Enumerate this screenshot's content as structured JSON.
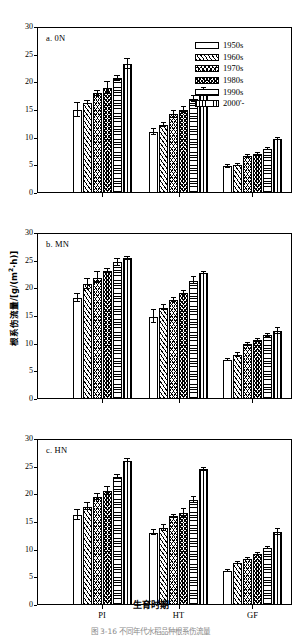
{
  "figure": {
    "ylabel": "根系伤流量/[g/(m2·h)]",
    "xlabel": "生育时期",
    "caption": "图 3-16   不同年代水稻品种根系伤流量"
  },
  "legend": {
    "items": [
      {
        "label": "1950s",
        "pattern": "p0"
      },
      {
        "label": "1960s",
        "pattern": "p1"
      },
      {
        "label": "1970s",
        "pattern": "p2"
      },
      {
        "label": "1980s",
        "pattern": "p3"
      },
      {
        "label": "1990s",
        "pattern": "p4"
      },
      {
        "label": "2000'-",
        "pattern": "p5"
      }
    ]
  },
  "axis": {
    "yticks": [
      "0",
      "5",
      "10",
      "15",
      "20",
      "25",
      "30"
    ],
    "ymin": 0,
    "ymax": 30,
    "categories": [
      "PI",
      "HT",
      "GF"
    ]
  },
  "chart_data": {
    "type": "bar",
    "title": "根系伤流量/[g/(m2·h)]",
    "xlabel": "生育时期",
    "ylabel": "根系伤流量/[g/(m2·h)]",
    "ylim": [
      0,
      30
    ],
    "yticks": [
      0,
      5,
      10,
      15,
      20,
      25,
      30
    ],
    "grid": false,
    "legend_position": "top-right of panel a",
    "categories": [
      "PI",
      "HT",
      "GF"
    ],
    "panels": [
      {
        "key": "a",
        "label": "a. 0N",
        "series": [
          {
            "name": "1950s",
            "pattern": "p0",
            "values": [
              15.0,
              11.0,
              4.8
            ],
            "errors": [
              1.2,
              0.5,
              0.2
            ]
          },
          {
            "name": "1960s",
            "pattern": "p1",
            "values": [
              16.3,
              12.3,
              5.1
            ],
            "errors": [
              0.3,
              0.3,
              0.2
            ]
          },
          {
            "name": "1970s",
            "pattern": "p2",
            "values": [
              18.0,
              14.2,
              6.6
            ],
            "errors": [
              0.5,
              0.7,
              0.2
            ]
          },
          {
            "name": "1980s",
            "pattern": "p3",
            "values": [
              19.0,
              15.0,
              7.0
            ],
            "errors": [
              1.1,
              0.5,
              0.3
            ]
          },
          {
            "name": "1990s",
            "pattern": "p4",
            "values": [
              20.7,
              17.0,
              8.0
            ],
            "errors": [
              0.4,
              0.5,
              0.2
            ]
          },
          {
            "name": "2000'-",
            "pattern": "p5",
            "values": [
              23.3,
              18.6,
              9.8
            ],
            "errors": [
              0.9,
              0.4,
              0.2
            ]
          }
        ]
      },
      {
        "key": "b",
        "label": "b. MN",
        "series": [
          {
            "name": "1950s",
            "pattern": "p0",
            "values": [
              18.3,
              14.9,
              7.0
            ],
            "errors": [
              0.7,
              1.1,
              0.2
            ]
          },
          {
            "name": "1960s",
            "pattern": "p1",
            "values": [
              20.8,
              16.5,
              8.0
            ],
            "errors": [
              0.9,
              0.5,
              0.4
            ]
          },
          {
            "name": "1970s",
            "pattern": "p2",
            "values": [
              21.9,
              17.9,
              9.9
            ],
            "errors": [
              1.0,
              0.3,
              0.3
            ]
          },
          {
            "name": "1980s",
            "pattern": "p3",
            "values": [
              23.1,
              19.2,
              10.6
            ],
            "errors": [
              0.4,
              0.4,
              0.3
            ]
          },
          {
            "name": "1990s",
            "pattern": "p4",
            "values": [
              24.7,
              21.4,
              11.5
            ],
            "errors": [
              0.6,
              0.6,
              0.3
            ]
          },
          {
            "name": "2000'-",
            "pattern": "p5",
            "values": [
              25.4,
              22.8,
              12.3
            ],
            "errors": [
              0.2,
              0.2,
              0.6
            ]
          }
        ]
      },
      {
        "key": "c",
        "label": "c. HN",
        "series": [
          {
            "name": "1950s",
            "pattern": "p0",
            "values": [
              16.3,
              13.1,
              6.1
            ],
            "errors": [
              0.9,
              0.5,
              0.2
            ]
          },
          {
            "name": "1960s",
            "pattern": "p1",
            "values": [
              17.8,
              13.9,
              7.6
            ],
            "errors": [
              0.7,
              0.5,
              0.2
            ]
          },
          {
            "name": "1970s",
            "pattern": "p2",
            "values": [
              19.5,
              16.0,
              8.3
            ],
            "errors": [
              0.6,
              0.3,
              0.2
            ]
          },
          {
            "name": "1980s",
            "pattern": "p3",
            "values": [
              20.6,
              16.6,
              9.2
            ],
            "errors": [
              0.8,
              0.8,
              0.2
            ]
          },
          {
            "name": "1990s",
            "pattern": "p4",
            "values": [
              23.1,
              19.0,
              10.3
            ],
            "errors": [
              0.4,
              0.5,
              0.2
            ]
          },
          {
            "name": "2000'-",
            "pattern": "p5",
            "values": [
              26.1,
              24.5,
              13.2
            ],
            "errors": [
              0.2,
              0.2,
              0.5
            ]
          }
        ]
      }
    ]
  }
}
